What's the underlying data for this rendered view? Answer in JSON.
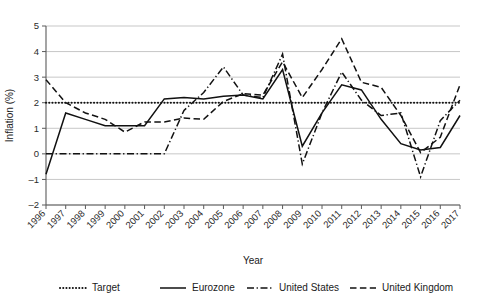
{
  "chart_data": {
    "type": "line",
    "title": "",
    "xlabel": "Year",
    "ylabel": "Inflation (%)",
    "xlim": [
      1996,
      2017
    ],
    "ylim": [
      -2,
      5
    ],
    "yticks": [
      -2,
      -1,
      0,
      1,
      2,
      3,
      4,
      5
    ],
    "grid": true,
    "legend_position": "bottom",
    "categories": [
      1996,
      1997,
      1998,
      1999,
      2000,
      2001,
      2002,
      2003,
      2004,
      2005,
      2006,
      2007,
      2008,
      2009,
      2010,
      2011,
      2012,
      2013,
      2014,
      2015,
      2016,
      2017
    ],
    "xtick_labels": [
      "1996",
      "1997",
      "1998",
      "1999",
      "2000",
      "2001",
      "2002",
      "2003",
      "2004",
      "2005",
      "2006",
      "2007",
      "2008",
      "2009",
      "2010",
      "2011",
      "2012",
      "2013",
      "2014",
      "2015",
      "2016",
      "2017"
    ],
    "series": [
      {
        "name": "Target",
        "style": "dotted",
        "color": "#111111",
        "values": [
          2,
          2,
          2,
          2,
          2,
          2,
          2,
          2,
          2,
          2,
          2,
          2,
          2,
          2,
          2,
          2,
          2,
          2,
          2,
          2,
          2,
          2
        ]
      },
      {
        "name": "Eurozone",
        "style": "solid",
        "color": "#111111",
        "values": [
          -0.8,
          1.6,
          1.35,
          1.1,
          1.1,
          1.1,
          2.15,
          2.2,
          2.15,
          2.25,
          2.3,
          2.15,
          3.3,
          0.3,
          1.6,
          2.7,
          2.5,
          1.35,
          0.4,
          0.15,
          0.25,
          1.5
        ]
      },
      {
        "name": "United States",
        "style": "dash-dot",
        "color": "#111111",
        "values": [
          0,
          0,
          0,
          0,
          0,
          0,
          0,
          1.7,
          2.4,
          3.4,
          2.3,
          2.2,
          3.9,
          -0.4,
          1.6,
          3.2,
          2.1,
          1.5,
          1.6,
          -0.9,
          1.3,
          2.1
        ]
      },
      {
        "name": "United Kingdom",
        "style": "dashed",
        "color": "#111111",
        "values": [
          2.9,
          2.0,
          1.6,
          1.35,
          0.85,
          1.25,
          1.25,
          1.4,
          1.35,
          2.05,
          2.35,
          2.3,
          3.6,
          2.2,
          3.3,
          4.5,
          2.8,
          2.6,
          1.5,
          0.05,
          0.65,
          2.7
        ]
      }
    ],
    "legend": [
      {
        "label": "Target",
        "style": "dotted"
      },
      {
        "label": "Eurozone",
        "style": "solid"
      },
      {
        "label": "United States",
        "style": "dash-dot"
      },
      {
        "label": "United Kingdom",
        "style": "dashed"
      }
    ]
  }
}
